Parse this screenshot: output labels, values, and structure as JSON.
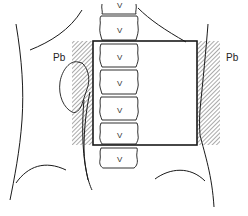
{
  "figure": {
    "labels": {
      "left_shield": "Pb",
      "right_shield": "Pb"
    },
    "vertebra_mark": "V",
    "colors": {
      "line": "#1a1a1a",
      "hatch": "#555555",
      "background": "#ffffff"
    },
    "field": {
      "x": 93,
      "y": 41,
      "width": 104,
      "height": 104
    },
    "shields": [
      {
        "side": "left",
        "x": 72,
        "y": 41,
        "width": 21,
        "height": 104
      },
      {
        "side": "right",
        "x": 197,
        "y": 41,
        "width": 23,
        "height": 104
      }
    ]
  }
}
